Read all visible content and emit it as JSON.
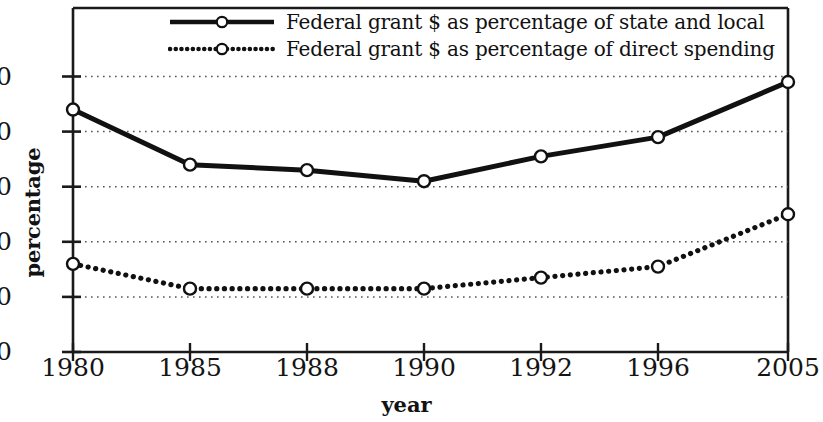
{
  "chart_data": {
    "type": "line",
    "title": "",
    "xlabel": "year",
    "ylabel": "percentage",
    "categories": [
      "1980",
      "1985",
      "1988",
      "1990",
      "1992",
      "1996",
      "2005"
    ],
    "x_tick_labels": [
      "1980",
      "1985",
      "1988",
      "1990",
      "1992",
      "1996",
      "2005"
    ],
    "y_tick_labels": [
      "0",
      "10",
      "20",
      "30",
      "40",
      "50"
    ],
    "y_ticks": [
      0,
      10,
      20,
      30,
      40,
      50
    ],
    "ylim": [
      0,
      57
    ],
    "grid": "horizontal-dotted",
    "legend_position": "top-center",
    "series": [
      {
        "name": "Federal grant $ as percentage of state and local",
        "style": "solid",
        "marker": "open-circle",
        "color": "#111111",
        "values": [
          44,
          34,
          33,
          31,
          35.5,
          39,
          49
        ]
      },
      {
        "name": "Federal grant $ as percentage of direct spending",
        "style": "dotted",
        "marker": "open-circle",
        "color": "#111111",
        "values": [
          16,
          11.5,
          11.5,
          11.5,
          13.5,
          15.5,
          25
        ]
      }
    ]
  },
  "axes": {
    "y_title": "percentage",
    "x_title": "year"
  },
  "legend": {
    "items": [
      {
        "label": "Federal grant $ as percentage of state and local",
        "style": "solid"
      },
      {
        "label": "Federal grant $ as percentage of direct spending",
        "style": "dotted"
      }
    ]
  },
  "colors": {
    "line": "#111111",
    "grid": "#555555",
    "frame": "#1a1a1a",
    "marker_fill": "#ffffff",
    "background": "#ffffff"
  }
}
